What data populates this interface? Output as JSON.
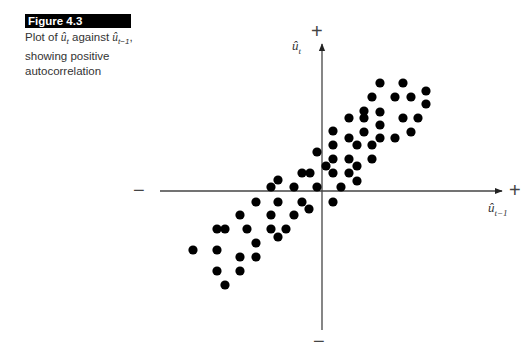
{
  "figure": {
    "label": "Figure 4.3",
    "caption_parts": {
      "prefix": "Plot of ",
      "var1": "û",
      "var1_sub": "t",
      "middle": " against ",
      "var2": "û",
      "var2_sub": "t−1",
      "suffix": ", showing positive autocorrelation"
    }
  },
  "axes": {
    "y_label": "û",
    "y_label_sub": "t",
    "x_label": "û",
    "x_label_sub": "t−1",
    "x_pos_sign": "+",
    "x_neg_sign": "−",
    "y_pos_sign": "+",
    "y_neg_sign": "−"
  },
  "chart_data": {
    "type": "scatter",
    "xlabel": "û_{t−1}",
    "ylabel": "û_t",
    "units": "pixel offsets from origin (x right positive, y up positive); axes unlabelled except +/− signs",
    "xlim": [
      -162,
      181
    ],
    "ylim": [
      -139,
      148
    ],
    "grid": false,
    "legend": null,
    "points": [
      [
        58,
        108
      ],
      [
        81,
        108
      ],
      [
        50,
        94
      ],
      [
        73,
        94
      ],
      [
        89,
        94
      ],
      [
        104,
        100
      ],
      [
        104,
        87
      ],
      [
        42,
        80
      ],
      [
        58,
        79
      ],
      [
        27,
        73
      ],
      [
        42,
        73
      ],
      [
        81,
        73
      ],
      [
        96,
        73
      ],
      [
        58,
        66
      ],
      [
        11,
        60
      ],
      [
        42,
        59
      ],
      [
        89,
        59
      ],
      [
        27,
        53
      ],
      [
        58,
        53
      ],
      [
        73,
        53
      ],
      [
        11,
        46
      ],
      [
        35,
        46
      ],
      [
        50,
        46
      ],
      [
        -5,
        39
      ],
      [
        11,
        32
      ],
      [
        27,
        32
      ],
      [
        50,
        32
      ],
      [
        4,
        25
      ],
      [
        35,
        25
      ],
      [
        -20,
        18
      ],
      [
        -12,
        18
      ],
      [
        11,
        18
      ],
      [
        27,
        18
      ],
      [
        35,
        10
      ],
      [
        -44,
        11
      ],
      [
        -51,
        4
      ],
      [
        -28,
        4
      ],
      [
        -5,
        4
      ],
      [
        19,
        4
      ],
      [
        -66,
        -11
      ],
      [
        -44,
        -11
      ],
      [
        -20,
        -11
      ],
      [
        11,
        -11
      ],
      [
        -13,
        -18
      ],
      [
        -82,
        -24
      ],
      [
        -51,
        -24
      ],
      [
        -28,
        -24
      ],
      [
        -105,
        -38
      ],
      [
        -97,
        -38
      ],
      [
        -75,
        -38
      ],
      [
        -51,
        -38
      ],
      [
        -36,
        -38
      ],
      [
        -44,
        -46
      ],
      [
        -66,
        -52
      ],
      [
        -129,
        -59
      ],
      [
        -105,
        -59
      ],
      [
        -82,
        -66
      ],
      [
        -66,
        -66
      ],
      [
        -105,
        -80
      ],
      [
        -82,
        -80
      ],
      [
        -97,
        -94
      ]
    ]
  },
  "colors": {
    "dot": "#000000",
    "axis": "#333333",
    "banner_bg": "#000000",
    "banner_text": "#ffffff"
  }
}
